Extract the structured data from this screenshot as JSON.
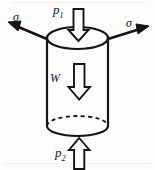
{
  "figure": {
    "type": "mechanics-free-body-diagram",
    "background_color": "#fdfdfd",
    "stroke_color": "#141414",
    "labels": {
      "sigma_left": "σ",
      "sigma_right": "σ",
      "pressure_top": "p",
      "pressure_top_sub": "1",
      "pressure_bottom": "p",
      "pressure_bottom_sub": "2",
      "weight": "W"
    },
    "arrows": {
      "sigma_left": {
        "style": "solid-line-with-filled-head",
        "direction": "up-left",
        "from": [
          47,
          38
        ],
        "to": [
          10,
          22
        ]
      },
      "sigma_right": {
        "style": "solid-line-with-filled-head",
        "direction": "up-right",
        "from": [
          108,
          38
        ],
        "to": [
          148,
          27
        ]
      },
      "pressure_top": {
        "style": "hollow-outline-block-arrow",
        "direction": "down",
        "x": 78,
        "y_top": 9,
        "y_bottom": 40
      },
      "weight": {
        "style": "hollow-outline-block-arrow",
        "direction": "down",
        "x": 79,
        "y_top": 64,
        "y_bottom": 99
      },
      "pressure_bottom": {
        "style": "hollow-outline-block-arrow",
        "direction": "up",
        "x": 79,
        "y_top": 139,
        "y_bottom": 168
      }
    },
    "cylinder": {
      "center_x": 77.5,
      "left_x": 47,
      "right_x": 108,
      "top_ellipse_cy": 38,
      "top_ellipse_rx": 30.5,
      "top_ellipse_ry": 11,
      "bottom_ellipse_cy": 126,
      "bottom_ellipse_rx": 30.5,
      "bottom_ellipse_ry": 10,
      "back_edge_style": "dashed",
      "front_edge_style": "solid"
    }
  }
}
